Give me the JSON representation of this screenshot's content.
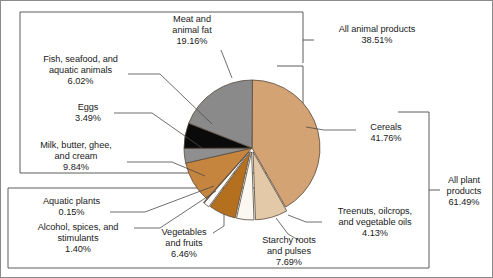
{
  "chart_data": {
    "type": "pie",
    "title": "",
    "subtitle": "",
    "xlabel": "",
    "ylabel": "",
    "legend_position": "callout-labels",
    "grid": false,
    "units": "percent",
    "total": 100.0,
    "start_angle_deg": 0,
    "direction": "clockwise",
    "categories": [
      "Cereals",
      "Starchy roots and pulses",
      "Treenuts, oilcrops, and vegetable oils",
      "Vegetables and fruits",
      "Alcohol, spices, and stimulants",
      "Aquatic plants",
      "Milk, butter, ghee, and cream",
      "Eggs",
      "Fish, seafood, and aquatic animals",
      "Meat and animal fat"
    ],
    "values": [
      41.76,
      7.69,
      4.13,
      6.46,
      1.4,
      0.15,
      9.84,
      3.49,
      6.02,
      19.16
    ],
    "colors": [
      "#d4a373",
      "#e3c9a8",
      "#fbf7f1",
      "#b5701f",
      "#fdfcfa",
      "#a8a8a8",
      "#c6853f",
      "#8f8f8f",
      "#0a0a0a",
      "#8a8a8a"
    ],
    "groups": [
      {
        "name": "All plant products",
        "value": 61.49,
        "members": [
          "Cereals",
          "Starchy roots and pulses",
          "Treenuts, oilcrops, and vegetable oils",
          "Vegetables and fruits",
          "Alcohol, spices, and stimulants",
          "Aquatic plants"
        ]
      },
      {
        "name": "All animal products",
        "value": 38.51,
        "members": [
          "Milk, butter, ghee, and cream",
          "Eggs",
          "Fish, seafood, and aquatic animals",
          "Meat and animal fat"
        ]
      }
    ],
    "slices": [
      {
        "label": "Cereals",
        "percent": "41.76%",
        "value": 41.76,
        "color": "#d4a373"
      },
      {
        "label": "Starchy roots and pulses",
        "percent": "7.69%",
        "value": 7.69,
        "color": "#e3c9a8"
      },
      {
        "label": "Treenuts, oilcrops, and vegetable oils",
        "percent": "4.13%",
        "value": 4.13,
        "color": "#fbf7f1"
      },
      {
        "label": "Vegetables and fruits",
        "percent": "6.46%",
        "value": 6.46,
        "color": "#b5701f"
      },
      {
        "label": "Alcohol, spices, and stimulants",
        "percent": "1.40%",
        "value": 1.4,
        "color": "#fdfcfa"
      },
      {
        "label": "Aquatic plants",
        "percent": "0.15%",
        "value": 0.15,
        "color": "#a8a8a8"
      },
      {
        "label": "Milk, butter, ghee, and cream",
        "percent": "9.84%",
        "value": 9.84,
        "color": "#c6853f"
      },
      {
        "label": "Eggs",
        "percent": "3.49%",
        "value": 3.49,
        "color": "#8f8f8f"
      },
      {
        "label": "Fish, seafood, and aquatic animals",
        "percent": "6.02%",
        "value": 6.02,
        "color": "#0a0a0a"
      },
      {
        "label": "Meat and animal fat",
        "percent": "19.16%",
        "value": 19.16,
        "color": "#8a8a8a"
      }
    ]
  },
  "labels": {
    "meat": "Meat and\nanimal fat\n19.16%",
    "fish": "Fish, seafood, and\naquatic animals\n6.02%",
    "eggs": "Eggs\n3.49%",
    "milk": "Milk, butter, ghee,\nand cream\n9.84%",
    "aquatic_plants": "Aquatic plants\n0.15%",
    "alcohol": "Alcohol, spices, and\nstimulants\n1.40%",
    "vegetables": "Vegetables\nand fruits\n6.46%",
    "starchy": "Starchy roots\nand pulses\n7.69%",
    "treenuts": "Treenuts, oilcrops,\nand vegetable oils\n4.13%",
    "cereals": "Cereals\n41.76%",
    "all_animal": "All animal products\n38.51%",
    "all_plant": "All plant\nproducts\n61.49%"
  }
}
